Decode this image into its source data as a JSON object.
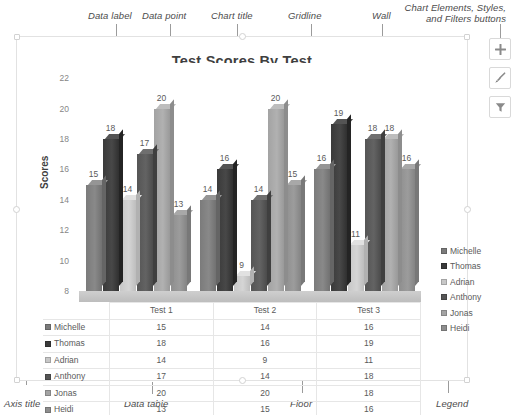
{
  "annotations": {
    "top": [
      {
        "label": "Data label",
        "text_x": 88,
        "text_y": 10,
        "line_x": 116,
        "line_y": 24,
        "line_h": 48
      },
      {
        "label": "Data point",
        "text_x": 142,
        "text_y": 10,
        "line_x": 170,
        "line_y": 24,
        "line_h": 62
      },
      {
        "label": "Chart title",
        "text_x": 211,
        "text_y": 10,
        "line_x": 237,
        "line_y": 24,
        "line_h": 30
      },
      {
        "label": "Gridline",
        "text_x": 288,
        "text_y": 10,
        "line_x": 311,
        "line_y": 24,
        "line_h": 36
      },
      {
        "label": "Wall",
        "text_x": 372,
        "text_y": 10,
        "line_x": 382,
        "line_y": 24,
        "line_h": 32
      }
    ],
    "buttons_note": {
      "label": "Chart Elements, Styles, and Filters buttons",
      "text_x": 388,
      "text_y": 2,
      "line_x": 500,
      "line_y": 24,
      "line_h": 14
    },
    "bottom": [
      {
        "label": "Axis title",
        "text_x": 4,
        "text_y": 398,
        "line_x": 26,
        "line_y": 160,
        "line_h": 225
      },
      {
        "label": "Data table",
        "text_x": 124,
        "text_y": 398,
        "line_x": 152,
        "line_y": 382,
        "line_h": 12
      },
      {
        "label": "Floor",
        "text_x": 290,
        "text_y": 398,
        "line_x": 302,
        "line_y": 265,
        "line_h": 128
      },
      {
        "label": "Legend",
        "text_x": 436,
        "text_y": 398,
        "line_x": 448,
        "line_y": 285,
        "line_h": 108
      }
    ]
  },
  "chart_buttons": [
    {
      "name": "chart-elements-button",
      "icon": "plus-icon"
    },
    {
      "name": "chart-styles-button",
      "icon": "paintbrush-icon"
    },
    {
      "name": "chart-filters-button",
      "icon": "funnel-icon"
    }
  ],
  "chart_data": {
    "type": "bar",
    "title": "Test Scores By Test",
    "xlabel": "",
    "ylabel": "Scores",
    "ylim": [
      8,
      23
    ],
    "yticks": [
      8,
      10,
      12,
      14,
      16,
      18,
      20,
      22
    ],
    "grid": true,
    "legend_position": "right",
    "categories": [
      "Test 1",
      "Test 2",
      "Test 3"
    ],
    "series": [
      {
        "name": "Michelle",
        "color": "#7b7b7b",
        "values": [
          15,
          14,
          16
        ]
      },
      {
        "name": "Thomas",
        "color": "#3a3a3a",
        "values": [
          18,
          16,
          19
        ]
      },
      {
        "name": "Adrian",
        "color": "#c7c7c7",
        "values": [
          14,
          9,
          11
        ]
      },
      {
        "name": "Anthony",
        "color": "#555555",
        "values": [
          17,
          14,
          18
        ]
      },
      {
        "name": "Jonas",
        "color": "#a3a3a3",
        "values": [
          20,
          20,
          18
        ]
      },
      {
        "name": "Heidi",
        "color": "#8e8e8e",
        "values": [
          13,
          15,
          16
        ]
      }
    ]
  }
}
